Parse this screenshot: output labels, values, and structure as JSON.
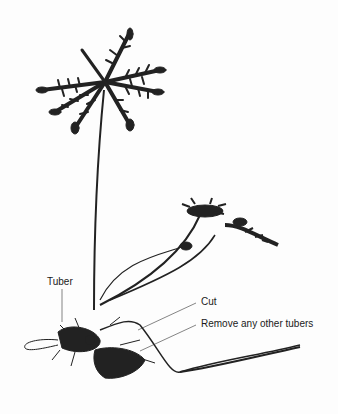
{
  "image": {
    "subject": "Plant with feathery leaves, long stems and tuberous roots on white background",
    "background_color": "#fdfdfd",
    "plant_color": "#1e1e1e"
  },
  "labels": {
    "tuber": "Tuber",
    "cut": "Cut",
    "remove": "Remove any other tubers"
  }
}
